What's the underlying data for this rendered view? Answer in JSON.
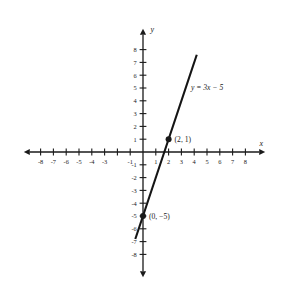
{
  "chart_data": {
    "type": "line",
    "title": "",
    "xlabel": "x",
    "ylabel": "y",
    "equation": "y = 3x − 5",
    "slope": 3,
    "intercept": -5,
    "xlim": [
      -9,
      9
    ],
    "ylim": [
      -9,
      9
    ],
    "grid": false,
    "legend": "none",
    "line_endpoints": [
      {
        "x": -0.6,
        "y": -6.8
      },
      {
        "x": 4.2,
        "y": 7.6
      }
    ],
    "x_ticks": [
      -8,
      -7,
      -6,
      -5,
      -4,
      -3,
      -2,
      -1,
      1,
      2,
      3,
      4,
      5,
      6,
      7,
      8
    ],
    "x_tick_labels": [
      "-8",
      "-7",
      "-6",
      "-5",
      "-4",
      "-3",
      "",
      "-1",
      "1",
      "2",
      "3",
      "4",
      "5",
      "6",
      "7",
      "8"
    ],
    "y_ticks": [
      -8,
      -7,
      -6,
      -5,
      -4,
      -3,
      -2,
      -1,
      1,
      2,
      3,
      4,
      5,
      6,
      7,
      8
    ],
    "y_tick_labels": [
      "-8",
      "-7",
      "-6",
      "-5",
      "-4",
      "-3",
      "-2",
      "-1",
      "1",
      "2",
      "3",
      "4",
      "5",
      "6",
      "7",
      "8"
    ],
    "points": [
      {
        "x": 2,
        "y": 1,
        "label": "(2, 1)"
      },
      {
        "x": 0,
        "y": -5,
        "label": "(0, −5)"
      }
    ],
    "colors": {
      "background": "#ffffff",
      "ink": "#1a1a1a",
      "line": "#141414"
    }
  },
  "axes": {
    "x_name": "x",
    "y_name": "y"
  }
}
